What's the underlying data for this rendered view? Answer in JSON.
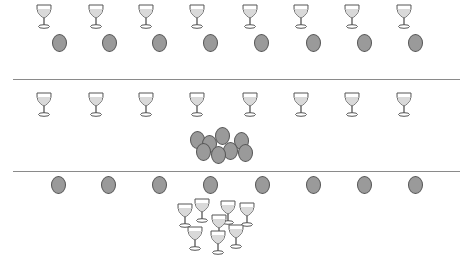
{
  "figure": {
    "type": "one-to-one correspondence illustration",
    "rows": [
      {
        "name": "row-1",
        "glasses": {
          "count": 8,
          "arrangement": "spread in a line",
          "xs": [
            44,
            96,
            146,
            197,
            250,
            301,
            352,
            404
          ],
          "y": 16
        },
        "ovals": {
          "count": 8,
          "arrangement": "spread in a line",
          "xs": [
            59,
            109,
            159,
            210,
            261,
            313,
            364,
            415
          ],
          "y": 43
        }
      },
      {
        "name": "row-2",
        "glasses": {
          "count": 8,
          "arrangement": "spread in a line",
          "xs": [
            44,
            96,
            146,
            197,
            250,
            301,
            352,
            404
          ],
          "y": 104
        },
        "ovals": {
          "count": 8,
          "arrangement": "clustered together",
          "positions": [
            [
              197,
              140
            ],
            [
              209,
              144
            ],
            [
              222,
              136
            ],
            [
              241,
              141
            ],
            [
              203,
              152
            ],
            [
              230,
              151
            ],
            [
              245,
              153
            ],
            [
              218,
              155
            ]
          ]
        }
      },
      {
        "name": "row-3",
        "ovals": {
          "count": 8,
          "arrangement": "spread in a line",
          "xs": [
            58,
            108,
            159,
            210,
            262,
            313,
            364,
            415
          ],
          "y": 185
        },
        "glasses": {
          "count": 8,
          "arrangement": "clustered together",
          "positions": [
            [
              185,
              215
            ],
            [
              202,
              210
            ],
            [
              228,
              212
            ],
            [
              247,
              214
            ],
            [
              219,
              226
            ],
            [
              195,
              238
            ],
            [
              218,
              242
            ],
            [
              236,
              236
            ]
          ]
        }
      }
    ],
    "dividers_y": [
      79,
      171
    ],
    "colors": {
      "oval_fill": "#9a9a9a",
      "oval_stroke": "#555555",
      "glass_bowl": "#d9d9d9",
      "glass_stroke": "#555555",
      "divider": "#8a8a8a"
    }
  },
  "caption": ""
}
